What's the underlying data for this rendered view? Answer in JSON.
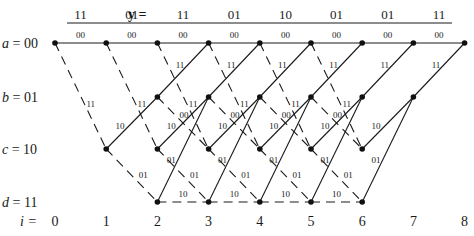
{
  "header": {
    "y_label": "y =",
    "received": [
      "11",
      "01",
      "11",
      "01",
      "10",
      "01",
      "01",
      "11"
    ]
  },
  "states": [
    {
      "name": "a",
      "bits": "00",
      "label": "a = 00"
    },
    {
      "name": "b",
      "bits": "01",
      "label": "b = 01"
    },
    {
      "name": "c",
      "bits": "10",
      "label": "c = 10"
    },
    {
      "name": "d",
      "bits": "11",
      "label": "d = 11"
    }
  ],
  "time_label": "i =",
  "times": [
    "0",
    "1",
    "2",
    "3",
    "4",
    "5",
    "6",
    "7",
    "8"
  ],
  "transitions": [
    {
      "from": "a",
      "to": "a",
      "out": "00",
      "input": 0
    },
    {
      "from": "a",
      "to": "c",
      "out": "11",
      "input": 1
    },
    {
      "from": "b",
      "to": "a",
      "out": "11",
      "input": 0
    },
    {
      "from": "b",
      "to": "c",
      "out": "00",
      "input": 1
    },
    {
      "from": "c",
      "to": "b",
      "out": "10",
      "input": 0
    },
    {
      "from": "c",
      "to": "d",
      "out": "01",
      "input": 1
    },
    {
      "from": "d",
      "to": "b",
      "out": "01",
      "input": 0
    },
    {
      "from": "d",
      "to": "d",
      "out": "10",
      "input": 1
    }
  ],
  "legend": {
    "solid": "input 0",
    "dashed": "input 1"
  },
  "info_stages": 6,
  "total_stages": 8
}
